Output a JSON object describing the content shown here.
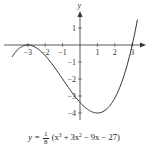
{
  "chart_data": {
    "type": "line",
    "title": "",
    "function_label": "y = 1/8 (x³ + 3x² − 9x − 27)",
    "xlabel": "",
    "ylabel": "y",
    "xlim": [
      -4.4,
      3.6
    ],
    "ylim": [
      -4.3,
      1.9
    ],
    "x_ticks": [
      -3,
      -2,
      -1,
      1,
      2,
      3
    ],
    "x_tick_labels": [
      "−3",
      "−2",
      "−1",
      "1",
      "2",
      "3"
    ],
    "y_ticks": [
      1,
      -1,
      -2,
      -3,
      -4
    ],
    "y_tick_labels": [
      "1",
      "−1",
      "−2",
      "−3",
      "−4"
    ],
    "grid": false,
    "series": [
      {
        "name": "y = (x^3 + 3x^2 - 9x - 27)/8",
        "x": [
          -3.9,
          -3.5,
          -3.0,
          -2.5,
          -2.0,
          -1.5,
          -1.0,
          -0.5,
          0.0,
          0.5,
          1.0,
          1.5,
          2.0,
          2.5,
          3.0,
          3.3
        ],
        "y": [
          -0.69,
          -0.16,
          0.0,
          -0.22,
          -0.63,
          -1.27,
          -2.0,
          -2.73,
          -3.38,
          -3.84,
          -4.0,
          -3.75,
          -3.13,
          -1.83,
          0.0,
          1.49
        ]
      }
    ],
    "key_points": [
      {
        "label": "local max",
        "x": -3,
        "y": 0
      },
      {
        "label": "local min",
        "x": 1,
        "y": -4
      },
      {
        "label": "y-intercept",
        "x": 0,
        "y": -3.375
      },
      {
        "label": "x-intercept",
        "x": 3,
        "y": 0
      }
    ]
  },
  "caption": {
    "lhs": "y = ",
    "frac_num": "1",
    "frac_den": "8",
    "rhs_open": " (x",
    "sup3": "3",
    "mid1": " + 3x",
    "sup2": "2",
    "rhs_close": " − 9x − 27)"
  },
  "axis_name_y": "y"
}
